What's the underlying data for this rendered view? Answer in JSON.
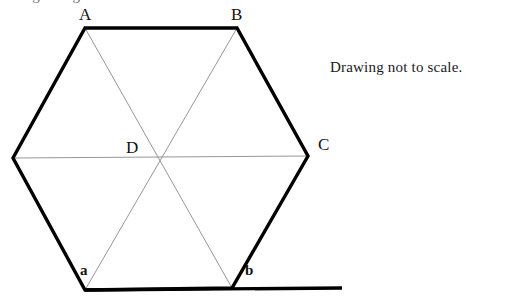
{
  "figure": {
    "note": "Drawing not to scale.",
    "partial_top_text": "angle diagram",
    "colors": {
      "background": "#ffffff",
      "outline": "#000000",
      "diagonal": "#8a8a8a",
      "label": "#111111"
    },
    "stroke": {
      "outline_width": 3.4,
      "diagonal_width": 0.9,
      "baseline_width": 3.4
    },
    "vertices": [
      {
        "name": "A",
        "label": "A",
        "x": 85,
        "y": 28,
        "label_x": 79,
        "label_y": 6
      },
      {
        "name": "B",
        "label": "B",
        "x": 237,
        "y": 28,
        "label_x": 231,
        "label_y": 6
      },
      {
        "name": "C",
        "label": "C",
        "x": 308,
        "y": 156,
        "label_x": 318,
        "label_y": 136
      },
      {
        "name": "b_vertex",
        "label": "",
        "x": 232,
        "y": 288,
        "label_x": 0,
        "label_y": 0
      },
      {
        "name": "a_vertex",
        "label": "",
        "x": 85,
        "y": 290,
        "label_x": 0,
        "label_y": 0
      },
      {
        "name": "left",
        "label": "",
        "x": 13,
        "y": 158,
        "label_x": 0,
        "label_y": 0
      }
    ],
    "center": {
      "name": "D",
      "label": "D",
      "x": 156,
      "y": 158,
      "label_x": 126,
      "label_y": 139
    },
    "angle_labels": [
      {
        "name": "a",
        "label": "a",
        "x": 80,
        "y": 263
      },
      {
        "name": "b",
        "label": "b",
        "x": 245,
        "y": 263
      }
    ],
    "baseline": {
      "x1": 85,
      "y1": 290,
      "x2": 342,
      "y2": 288
    },
    "note_position": {
      "x": 330,
      "y": 59
    }
  }
}
